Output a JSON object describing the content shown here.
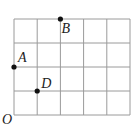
{
  "diagram": {
    "grid": {
      "cols": 5,
      "rows": 4,
      "line_color": "#9a9a9a"
    },
    "origin_label": "O",
    "points": [
      {
        "label": "A",
        "x": 0,
        "y": 2
      },
      {
        "label": "B",
        "x": 2,
        "y": 4
      },
      {
        "label": "D",
        "x": 1,
        "y": 1
      }
    ],
    "point_color": "#111111"
  }
}
